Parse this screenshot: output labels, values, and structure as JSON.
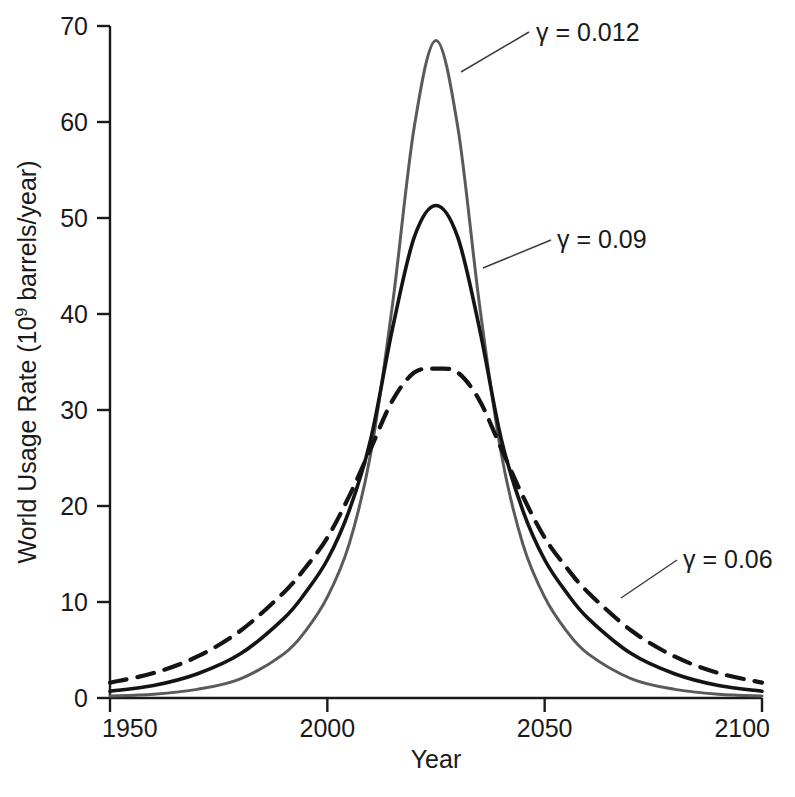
{
  "chart_data": {
    "type": "line",
    "title": "",
    "xlabel": "Year",
    "ylabel_prefix": "World Usage Rate (10",
    "ylabel_exponent": "9",
    "ylabel_suffix": " barrels/year)",
    "ylabel_full": "World Usage Rate (10⁹ barrels/year)",
    "xlim": [
      1950,
      2100
    ],
    "ylim": [
      0,
      70
    ],
    "xticks": [
      1950,
      2000,
      2050,
      2100
    ],
    "xtick_labels": [
      "1950",
      "2000",
      "2050",
      "2100"
    ],
    "yticks": [
      0,
      10,
      20,
      30,
      40,
      50,
      60,
      70
    ],
    "ytick_labels": [
      "0",
      "10",
      "20",
      "30",
      "40",
      "50",
      "60",
      "70"
    ],
    "grid": false,
    "legend_position": "annotations-on-curves",
    "series": [
      {
        "name": "gamma-0.012",
        "label": "γ = 0.012",
        "style": "solid",
        "color": "#5a5a5a",
        "linewidth": 3,
        "peak_year": 2025,
        "peak_value": 68.5,
        "x": [
          1950,
          1960,
          1970,
          1980,
          1990,
          1995,
          2000,
          2005,
          2010,
          2015,
          2020,
          2025,
          2030,
          2035,
          2040,
          2045,
          2050,
          2055,
          2060,
          2070,
          2080,
          2090,
          2100
        ],
        "y": [
          0.2,
          0.4,
          0.9,
          2.0,
          4.6,
          7.0,
          10.5,
          16.0,
          25.5,
          41.0,
          59.5,
          68.5,
          59.5,
          41.0,
          25.5,
          16.0,
          10.5,
          7.0,
          4.6,
          2.0,
          0.9,
          0.4,
          0.2
        ]
      },
      {
        "name": "gamma-0.09",
        "label": "γ = 0.09",
        "style": "solid",
        "color": "#141414",
        "linewidth": 3.6,
        "peak_year": 2025,
        "peak_value": 51.3,
        "x": [
          1950,
          1960,
          1970,
          1980,
          1990,
          1995,
          2000,
          2005,
          2010,
          2015,
          2020,
          2025,
          2030,
          2035,
          2040,
          2045,
          2050,
          2055,
          2060,
          2070,
          2080,
          2090,
          2100
        ],
        "y": [
          0.7,
          1.3,
          2.5,
          4.6,
          8.3,
          11.0,
          14.4,
          19.5,
          27.0,
          38.5,
          48.0,
          51.3,
          48.0,
          38.5,
          27.0,
          19.5,
          14.4,
          11.0,
          8.3,
          4.6,
          2.5,
          1.3,
          0.7
        ]
      },
      {
        "name": "gamma-0.06",
        "label": "γ = 0.06",
        "style": "dashed",
        "color": "#141414",
        "linewidth": 4.2,
        "peak_year": 2025,
        "peak_value": 34.3,
        "x": [
          1950,
          1960,
          1970,
          1980,
          1990,
          1995,
          2000,
          2005,
          2010,
          2015,
          2020,
          2025,
          2030,
          2035,
          2040,
          2045,
          2050,
          2055,
          2060,
          2070,
          2080,
          2090,
          2100
        ],
        "y": [
          1.6,
          2.6,
          4.3,
          7.0,
          11.0,
          13.6,
          16.7,
          21.0,
          26.0,
          31.0,
          33.9,
          34.3,
          33.9,
          31.0,
          26.0,
          21.0,
          16.7,
          13.6,
          11.0,
          7.0,
          4.3,
          2.6,
          1.6
        ]
      }
    ],
    "annotations": [
      {
        "name": "gamma-0.012",
        "text": "γ = 0.012",
        "label_x": 536,
        "label_y": 41,
        "leader_from_x": 529,
        "leader_from_y": 32,
        "leader_to_x": 461,
        "leader_to_y": 72
      },
      {
        "name": "gamma-0.09",
        "text": "γ = 0.09",
        "label_x": 557,
        "label_y": 248,
        "leader_from_x": 551,
        "leader_from_y": 240,
        "leader_to_x": 483,
        "leader_to_y": 268
      },
      {
        "name": "gamma-0.06",
        "text": "γ = 0.06",
        "label_x": 683,
        "label_y": 568,
        "leader_from_x": 677,
        "leader_from_y": 560,
        "leader_to_x": 621,
        "leader_to_y": 598
      }
    ]
  },
  "axes": {
    "x_title": "Year",
    "y_title_prefix": "World Usage Rate (10",
    "y_title_exponent": "9",
    "y_title_suffix": " barrels/year)"
  },
  "colors": {
    "background": "#ffffff",
    "axis": "#1a1a1a",
    "text": "#1a1a1a",
    "curve_gray": "#5a5a5a",
    "curve_black": "#141414",
    "leader_line": "#3c3c3c"
  }
}
